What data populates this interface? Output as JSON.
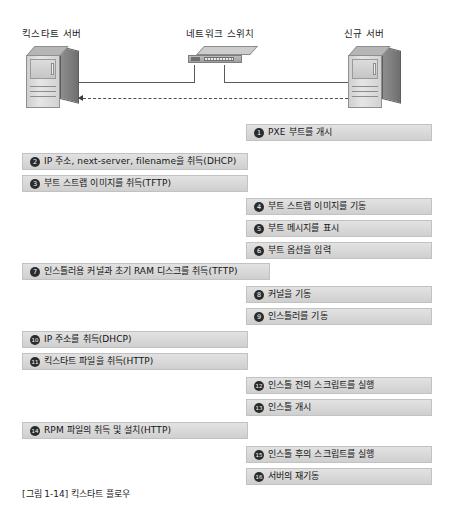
{
  "figure": {
    "caption": "[그림 1-14] 킥스타트 플로우"
  },
  "devices": [
    {
      "id": "kickstart-server",
      "label": "킥스타트 서버",
      "type": "server-tower"
    },
    {
      "id": "network-switch",
      "label": "네트워크 스위치",
      "type": "network-switch"
    },
    {
      "id": "new-server",
      "label": "신규 서버",
      "type": "server-tower"
    }
  ],
  "colors": {
    "box_fill_top": "#e2e2e2",
    "box_fill_bottom": "#cfcfcf",
    "box_border": "#c2c2c2",
    "badge_fill": "#2b2b2b",
    "badge_text": "#ffffff",
    "text": "#141414",
    "line": "#5a5a5a"
  },
  "steps": [
    {
      "num": "❶",
      "text": "PXE 부트를 개시",
      "side": "right",
      "top": 124
    },
    {
      "num": "❷",
      "text": "IP 주소, next-server, filename을 취득(DHCP)",
      "side": "left",
      "top": 153
    },
    {
      "num": "❸",
      "text": "부트 스트랩 이미지를 취득(TFTP)",
      "side": "left",
      "top": 175
    },
    {
      "num": "❹",
      "text": "부트 스트랩 이미지를 기동",
      "side": "right",
      "top": 198
    },
    {
      "num": "❺",
      "text": "부트 메시지를 표시",
      "side": "right",
      "top": 220
    },
    {
      "num": "❻",
      "text": "부트 옵션을 입력",
      "side": "right",
      "top": 242
    },
    {
      "num": "❼",
      "text": "인스톨러용 커널과 초기 RAM 디스크를 취득(TFTP)",
      "side": "wide",
      "top": 263
    },
    {
      "num": "❽",
      "text": "커널을 기동",
      "side": "right",
      "top": 286
    },
    {
      "num": "❾",
      "text": "인스톨러를 기동",
      "side": "right",
      "top": 308
    },
    {
      "num": "❿",
      "text": "IP 주소를 취득(DHCP)",
      "side": "left",
      "top": 331
    },
    {
      "num": "⓫",
      "text": "킥스타트 파일을 취득(HTTP)",
      "side": "left",
      "top": 353
    },
    {
      "num": "⓬",
      "text": "인스톨 전의 스크립트를 실행",
      "side": "right",
      "top": 377
    },
    {
      "num": "⓭",
      "text": "인스톨 개시",
      "side": "right",
      "top": 399
    },
    {
      "num": "⓮",
      "text": "RPM 파일의 취득 및 설치(HTTP)",
      "side": "left",
      "top": 422
    },
    {
      "num": "⓯",
      "text": "인스톨 후의 스크립트를 실행",
      "side": "right",
      "top": 446
    },
    {
      "num": "⓰",
      "text": "서버의 재기동",
      "side": "right",
      "top": 468
    }
  ]
}
